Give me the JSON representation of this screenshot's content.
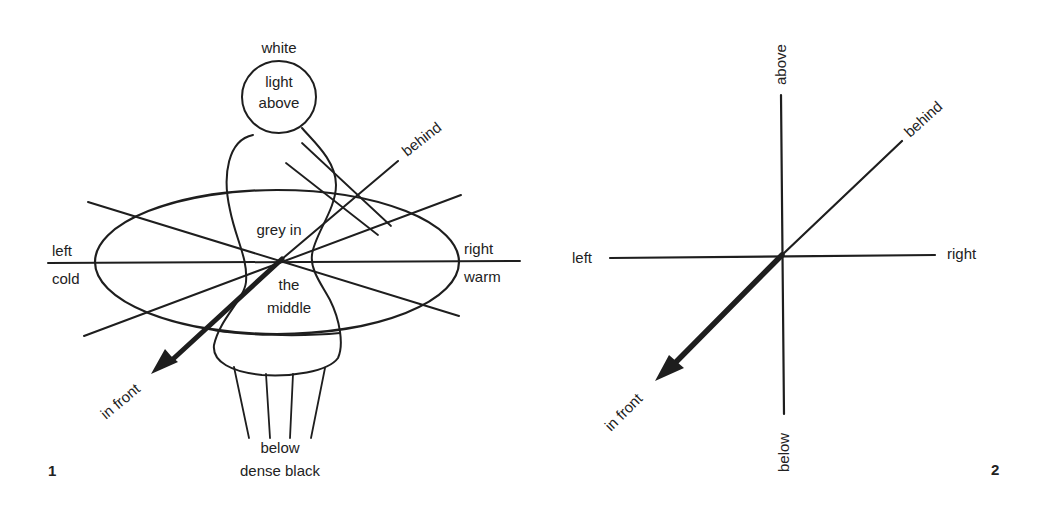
{
  "figure1": {
    "number": "1",
    "labels": {
      "top": "white",
      "head_line1": "light",
      "head_line2": "above",
      "behind": "behind",
      "center_upper": "grey in",
      "center_lower1": "the",
      "center_lower2": "middle",
      "left": "left",
      "left_sub": "cold",
      "right": "right",
      "right_sub": "warm",
      "front": "in front",
      "bottom1": "below",
      "bottom2": "dense black"
    }
  },
  "figure2": {
    "number": "2",
    "labels": {
      "above": "above",
      "behind": "behind",
      "left": "left",
      "right": "right",
      "front": "in front",
      "below": "below"
    }
  },
  "colors": {
    "ink": "#1e1e1e",
    "background": "#ffffff"
  }
}
